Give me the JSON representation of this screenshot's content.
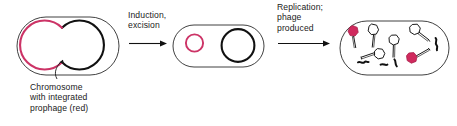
{
  "figure": {
    "width": 457,
    "height": 126,
    "background": "#ffffff"
  },
  "colors": {
    "prophage_red": "#cc3366",
    "phage_head_fill": "#d02a5e",
    "chromosome_black": "#111111",
    "cell_outline": "#2b2b2b",
    "text": "#1a1a1a",
    "arrow": "#111111",
    "phage_outline": "#1a1a1a",
    "phage_head_white": "#ffffff"
  },
  "steps": [
    {
      "id": "stage-1",
      "cell_label": "",
      "caption": "Chromosome\nwith integrated\nprophage (red)",
      "caption_lines": [
        "Chromosome",
        "with integrated",
        "prophage (red)"
      ],
      "contents": "circular chromosome with red prophage segment integrated"
    },
    {
      "id": "stage-2",
      "transition_label": "Induction,\nexcision",
      "transition_lines": [
        "Induction,",
        "excision"
      ],
      "contents": "excised circular red phage genome and black bacterial chromosome"
    },
    {
      "id": "stage-3",
      "transition_label": "Replication;\nphage\nproduced",
      "transition_lines": [
        "Replication;",
        "phage",
        "produced"
      ],
      "contents": "many assembled phage particles and degraded chromosome fragments"
    }
  ],
  "annotations": {
    "pointer_target": "red prophage region of chromosome"
  },
  "phages": [
    {
      "id": "phage-1",
      "head": "filled-red",
      "orientation": "tail-down"
    },
    {
      "id": "phage-2",
      "head": "white",
      "orientation": "tail-down"
    },
    {
      "id": "phage-3",
      "head": "white",
      "orientation": "tail-down-right"
    },
    {
      "id": "phage-4",
      "head": "white",
      "orientation": "tail-down"
    },
    {
      "id": "phage-5",
      "head": "white",
      "orientation": "tail-left"
    },
    {
      "id": "phage-6",
      "head": "filled-red",
      "orientation": "tail-up-right"
    }
  ],
  "dna_fragments": [
    {
      "id": "fragment-1"
    },
    {
      "id": "fragment-2"
    },
    {
      "id": "fragment-3"
    },
    {
      "id": "fragment-4"
    }
  ]
}
